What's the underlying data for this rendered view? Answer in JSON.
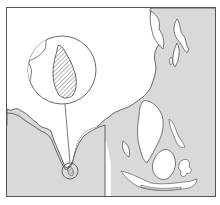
{
  "map": {
    "title": "Sri Lanka locator map",
    "region": "South and Southeast Asia",
    "highlighted_country": "Sri Lanka",
    "colors": {
      "land": "#d9d9d9",
      "sea": "#ffffff",
      "coastline": "#444444",
      "frame": "#555555",
      "highlight_hatch": "#444444"
    },
    "inset": {
      "label": "Sri Lanka (enlarged)",
      "shape": "circle"
    }
  }
}
